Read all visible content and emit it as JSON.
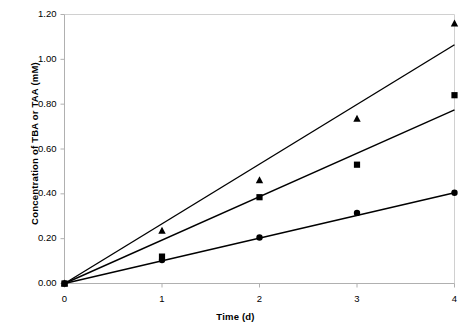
{
  "chart_data": {
    "type": "scatter",
    "title": "",
    "xlabel": "Time (d)",
    "ylabel": "Concentration of TBA or TAA (mM)",
    "xlim": [
      0,
      4
    ],
    "ylim": [
      0,
      1.2
    ],
    "x_ticks": [
      "0",
      "1",
      "2",
      "3",
      "4"
    ],
    "y_ticks": [
      "0.00",
      "0.20",
      "0.40",
      "0.60",
      "0.80",
      "1.00",
      "1.20"
    ],
    "x_tick_values": [
      0,
      1,
      2,
      3,
      4
    ],
    "y_tick_values": [
      0.0,
      0.2,
      0.4,
      0.6,
      0.8,
      1.0,
      1.2
    ],
    "grid": false,
    "legend": "none",
    "x": [
      0,
      1,
      2,
      3,
      4
    ],
    "series": [
      {
        "name": "triangle-series",
        "marker": "triangle",
        "color": "#000000",
        "values": [
          0.0,
          0.235,
          0.46,
          0.735,
          1.16
        ],
        "trendline": {
          "x0": 0,
          "y0": 0.0,
          "x1": 4,
          "y1": 1.065
        }
      },
      {
        "name": "square-series",
        "marker": "square",
        "color": "#000000",
        "values": [
          0.0,
          0.12,
          0.385,
          0.53,
          0.84
        ],
        "trendline": {
          "x0": 0,
          "y0": 0.0,
          "x1": 4,
          "y1": 0.775
        }
      },
      {
        "name": "circle-series",
        "marker": "circle",
        "color": "#000000",
        "values": [
          0.0,
          0.105,
          0.205,
          0.315,
          0.405
        ],
        "trendline": {
          "x0": 0,
          "y0": 0.0,
          "x1": 4,
          "y1": 0.405
        }
      }
    ],
    "axis_color": "#b0b0b0",
    "plot_border_color": "#d0d0d0"
  }
}
